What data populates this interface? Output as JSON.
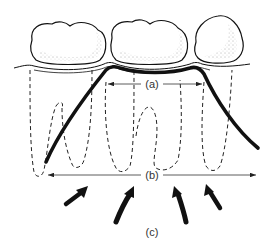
{
  "diagram": {
    "labels": {
      "a": "(a)",
      "b": "(b)",
      "c": "(c)"
    },
    "colors": {
      "line": "#111111",
      "dash": "#222222",
      "stipple": "#555555",
      "background": "#ffffff"
    }
  }
}
